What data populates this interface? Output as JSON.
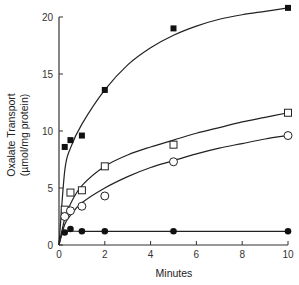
{
  "chart_data": {
    "type": "line",
    "title": "",
    "xlabel": "Minutes",
    "ylabel": "Oxalate Transport",
    "ylabel_units": "(µmol/mg protein)",
    "xlim": [
      0,
      10
    ],
    "ylim": [
      0,
      20
    ],
    "x_ticks": [
      0,
      2,
      4,
      6,
      8,
      10
    ],
    "y_ticks": [
      0,
      5,
      10,
      15,
      20
    ],
    "grid": false,
    "legend": null,
    "series": [
      {
        "name": "filled-squares",
        "marker": "filled-square",
        "x": [
          0.25,
          0.5,
          1,
          2,
          5,
          10
        ],
        "y": [
          8.6,
          9.2,
          9.6,
          13.6,
          19.0,
          20.8
        ],
        "curve": [
          [
            0,
            0
          ],
          [
            0.25,
            6.5
          ],
          [
            0.5,
            8.5
          ],
          [
            1,
            10.6
          ],
          [
            2,
            13.6
          ],
          [
            3,
            15.8
          ],
          [
            4,
            17.3
          ],
          [
            5,
            18.4
          ],
          [
            6,
            19.2
          ],
          [
            7,
            19.8
          ],
          [
            8,
            20.2
          ],
          [
            9,
            20.5
          ],
          [
            10,
            20.8
          ]
        ]
      },
      {
        "name": "open-squares",
        "marker": "open-square",
        "x": [
          0.25,
          0.5,
          1,
          2,
          5,
          10
        ],
        "y": [
          3.1,
          4.6,
          4.8,
          6.9,
          8.8,
          11.6
        ],
        "curve": [
          [
            0,
            0
          ],
          [
            0.25,
            2.3
          ],
          [
            0.5,
            3.6
          ],
          [
            1,
            5.2
          ],
          [
            2,
            6.9
          ],
          [
            3,
            7.9
          ],
          [
            4,
            8.6
          ],
          [
            5,
            9.2
          ],
          [
            6,
            9.8
          ],
          [
            7,
            10.3
          ],
          [
            8,
            10.8
          ],
          [
            9,
            11.2
          ],
          [
            10,
            11.6
          ]
        ]
      },
      {
        "name": "open-circles",
        "marker": "open-circle",
        "x": [
          0.25,
          0.5,
          1,
          2,
          5,
          10
        ],
        "y": [
          2.5,
          3.0,
          3.4,
          4.3,
          7.3,
          9.6
        ],
        "curve": [
          [
            0,
            0
          ],
          [
            0.25,
            1.8
          ],
          [
            0.5,
            2.6
          ],
          [
            1,
            3.7
          ],
          [
            2,
            5.0
          ],
          [
            3,
            6.0
          ],
          [
            4,
            6.8
          ],
          [
            5,
            7.4
          ],
          [
            6,
            8.0
          ],
          [
            7,
            8.5
          ],
          [
            8,
            8.9
          ],
          [
            9,
            9.3
          ],
          [
            10,
            9.6
          ]
        ]
      },
      {
        "name": "filled-circles",
        "marker": "filled-circle",
        "x": [
          0.25,
          0.5,
          1,
          2,
          5,
          10
        ],
        "y": [
          1.1,
          1.4,
          1.2,
          1.2,
          1.2,
          1.2
        ],
        "curve": [
          [
            0,
            0.3
          ],
          [
            0.15,
            1.0
          ],
          [
            0.3,
            1.2
          ],
          [
            1,
            1.2
          ],
          [
            2,
            1.2
          ],
          [
            5,
            1.2
          ],
          [
            10,
            1.2
          ]
        ]
      }
    ]
  },
  "axis": {
    "x_label": "Minutes",
    "y_label_line1": "Oxalate Transport",
    "y_label_line2": "(µmol/mg protein)"
  }
}
